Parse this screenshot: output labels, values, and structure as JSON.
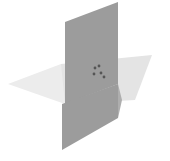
{
  "figure": {
    "background_color": "#ffffff",
    "width": 170,
    "height": 161
  },
  "chart_data": {
    "type": "diagram",
    "title": "",
    "subtitle": "",
    "xlabel": "",
    "ylabel": "",
    "grid": false,
    "legend": false,
    "projection": "isometric",
    "shapes": [
      {
        "name": "horizontal-plane-left-quad",
        "label": "Horizontal plane, far-left quadrant",
        "fill": "#ececec",
        "points": "8,84 61,64 118,84 65,104"
      },
      {
        "name": "horizontal-plane-right-quad",
        "label": "Horizontal plane, right quadrant",
        "fill": "#e4e4e4",
        "points": "61,64 152,55 135,100 65,104"
      },
      {
        "name": "vertical-plane-upper",
        "label": "Vertical plane, upper portion",
        "fill": "#9c9c9c",
        "points": "118,2 118,84 65,104 65,22"
      },
      {
        "name": "vertical-plane-lower",
        "label": "Vertical plane, lower portion",
        "fill": "#9c9c9c",
        "points": "118,84 118,118 62,150 62,104"
      },
      {
        "name": "vertical-plane-lower-shadow",
        "label": "Vertical plane lower shading edge",
        "fill": "#aeaeae",
        "points": "118,84 122,100 118,118"
      }
    ],
    "markers": [
      {
        "name": "point-marker-a",
        "x": 95,
        "y": 68,
        "r": 1.4,
        "color": "#555555"
      },
      {
        "name": "point-marker-b",
        "x": 99,
        "y": 66,
        "r": 1.4,
        "color": "#555555"
      },
      {
        "name": "point-marker-c",
        "x": 94,
        "y": 74,
        "r": 1.4,
        "color": "#555555"
      },
      {
        "name": "point-marker-d",
        "x": 101,
        "y": 73,
        "r": 1.4,
        "color": "#555555"
      },
      {
        "name": "point-marker-e",
        "x": 104,
        "y": 77,
        "r": 1.4,
        "color": "#555555"
      }
    ],
    "colors": {
      "vertical_plane": "#9c9c9c",
      "horizontal_plane_light": "#ececec",
      "horizontal_plane_mid": "#e4e4e4",
      "marker": "#555555",
      "background": "#ffffff"
    }
  }
}
